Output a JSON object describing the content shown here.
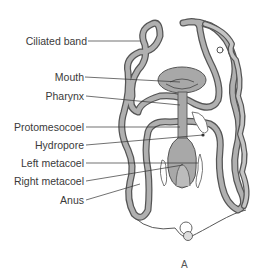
{
  "figure": {
    "caption": "A",
    "labels": [
      {
        "id": "ciliated-band",
        "text": "Ciliated band"
      },
      {
        "id": "mouth",
        "text": "Mouth"
      },
      {
        "id": "pharynx",
        "text": "Pharynx"
      },
      {
        "id": "protomesocoel",
        "text": "Protomesocoel"
      },
      {
        "id": "hydropore",
        "text": "Hydropore"
      },
      {
        "id": "left-metacoel",
        "text": "Left metacoel"
      },
      {
        "id": "right-metacoel",
        "text": "Right metacoel"
      },
      {
        "id": "anus",
        "text": "Anus"
      }
    ]
  },
  "colors": {
    "band_fill": "#a8a8a8",
    "band_stroke": "#555555",
    "organ_fill": "#a0a0a0",
    "leader": "#333333",
    "text": "#3a3a3a"
  }
}
